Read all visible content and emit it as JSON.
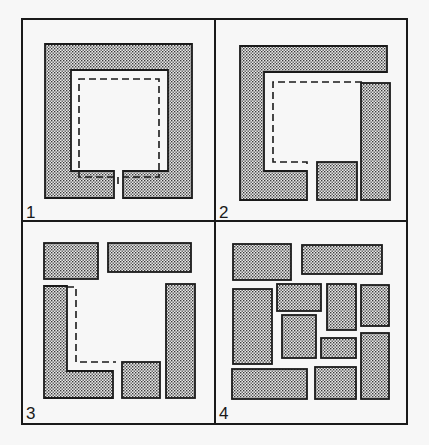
{
  "colors": {
    "background": "#f7f7f7",
    "panel": "#f7f7f7",
    "stroke": "#1a1a1a",
    "dot": "#3a3a3a",
    "dot_bg": "#e9e9e9"
  },
  "panels": [
    {
      "label": "1",
      "description": "Enclosed square room with a single narrow gap at the bottom; dashed path traces the inner perimeter",
      "shapes": [
        {
          "type": "path",
          "d": "M45 44 H192 V198 H123 V171 H168 V70 H71 V171 H114 V198 H45 Z"
        }
      ],
      "dashed": "M118 184 V177 H79 V79 H159 V177 H123"
    },
    {
      "label": "2",
      "description": "Enclosure broken into a C-shape, a small square and a tall bar",
      "shapes": [
        {
          "type": "path",
          "d": "M240 46 H387 V72 H264 V171 H307 V200 H240 Z"
        },
        {
          "type": "rect",
          "x": 317,
          "y": 162,
          "w": 40,
          "h": 38
        },
        {
          "type": "rect",
          "x": 361,
          "y": 83,
          "w": 29,
          "h": 117
        }
      ],
      "dashed": "M362 82 H273 V162 H307 V166"
    },
    {
      "label": "3",
      "description": "Further fragmentation: two top blocks, an L-shape, a small square and a tall bar",
      "shapes": [
        {
          "type": "rect",
          "x": 44,
          "y": 243,
          "w": 54,
          "h": 36
        },
        {
          "type": "rect",
          "x": 108,
          "y": 243,
          "w": 83,
          "h": 29
        },
        {
          "type": "path",
          "d": "M44 286 H67 V371 H113 V398 H44 Z"
        },
        {
          "type": "rect",
          "x": 122,
          "y": 362,
          "w": 38,
          "h": 36
        },
        {
          "type": "rect",
          "x": 166,
          "y": 284,
          "w": 29,
          "h": 114
        }
      ],
      "dashed": "M67 287 H76 V362 H116"
    },
    {
      "label": "4",
      "description": "Fully fragmented into separate rectangular blocks",
      "shapes": [
        {
          "type": "rect",
          "x": 233,
          "y": 244,
          "w": 58,
          "h": 36
        },
        {
          "type": "rect",
          "x": 302,
          "y": 245,
          "w": 80,
          "h": 29
        },
        {
          "type": "rect",
          "x": 233,
          "y": 289,
          "w": 39,
          "h": 75
        },
        {
          "type": "rect",
          "x": 277,
          "y": 284,
          "w": 44,
          "h": 27
        },
        {
          "type": "rect",
          "x": 327,
          "y": 284,
          "w": 29,
          "h": 46
        },
        {
          "type": "rect",
          "x": 361,
          "y": 285,
          "w": 28,
          "h": 41
        },
        {
          "type": "rect",
          "x": 282,
          "y": 315,
          "w": 34,
          "h": 43
        },
        {
          "type": "rect",
          "x": 321,
          "y": 338,
          "w": 35,
          "h": 20
        },
        {
          "type": "rect",
          "x": 361,
          "y": 333,
          "w": 28,
          "h": 66
        },
        {
          "type": "rect",
          "x": 232,
          "y": 369,
          "w": 75,
          "h": 30
        },
        {
          "type": "rect",
          "x": 315,
          "y": 367,
          "w": 41,
          "h": 32
        }
      ],
      "dashed": ""
    }
  ],
  "frame": {
    "x": 22,
    "y": 19,
    "w": 385,
    "h": 405,
    "mid_x": 215,
    "mid_y": 221
  },
  "label_positions": [
    {
      "x": 26,
      "y": 218
    },
    {
      "x": 219,
      "y": 218
    },
    {
      "x": 26,
      "y": 419
    },
    {
      "x": 219,
      "y": 419
    }
  ]
}
